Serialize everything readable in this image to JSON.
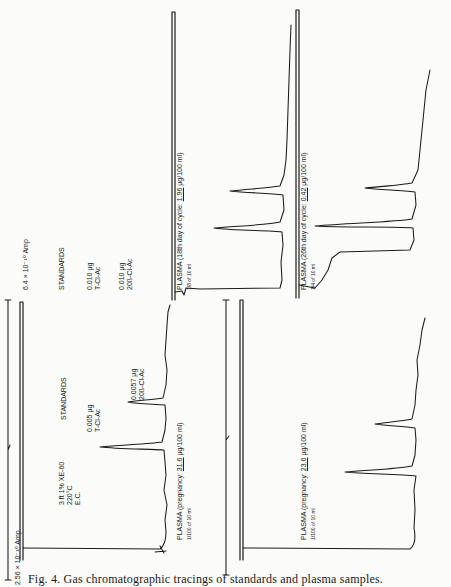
{
  "figure": {
    "caption": "Fig. 4. Gas chromatographic tracings of standards and plasma samples.",
    "panels": [
      {
        "id": "standards-top",
        "title": "STANDARDS",
        "peak1": [
          "0.005 μg",
          "T-Cl-Ac"
        ],
        "peak2": [
          "0.0057 μg",
          "20ß-Cl-Ac"
        ],
        "conditions": [
          "3 ft 1% XE-60",
          "220°C",
          "E.C."
        ],
        "scale": "2.56 × 10⁻¹⁰ Amp"
      },
      {
        "id": "plasma-18th",
        "title_prefix": "PLASMA (18th day of cycle: ",
        "title_value": "1.96",
        "title_suffix": " μg/100 ml)",
        "fraction": "1/8 of 10 ml"
      },
      {
        "id": "plasma-26th",
        "title_prefix": "PLASMA (26th day of cycle: ",
        "title_value": "0.42",
        "title_suffix": " μg/100 ml)",
        "fraction": "1/4 of 10 ml"
      },
      {
        "id": "standards-bottom",
        "title": "STANDARDS",
        "peak1": [
          "0.010 μg",
          "T-Cl-Ac"
        ],
        "peak2": [
          "0.010 μg",
          "20ß-Cl-Ac"
        ],
        "scale": "6.4 × 10⁻¹⁰ Amp"
      },
      {
        "id": "plasma-pregnancy-31",
        "title_prefix": "PLASMA (pregnancy: ",
        "title_value": "31.6",
        "title_suffix": " μg/100 ml)",
        "fraction": "1/100 of 10 ml"
      },
      {
        "id": "plasma-pregnancy-23",
        "title_prefix": "PLASMA (pregnancy: ",
        "title_value": "23.6",
        "title_suffix": " μg/100 ml)",
        "fraction": "1/100 of 10 ml"
      }
    ]
  }
}
